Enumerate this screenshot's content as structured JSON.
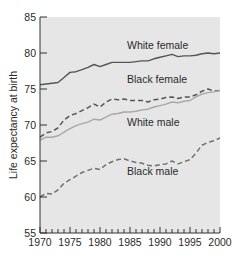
{
  "chart_data": {
    "type": "line",
    "title": "",
    "xlabel": "",
    "ylabel": "Life expectancy at birth",
    "xlim": [
      1970,
      2000
    ],
    "ylim": [
      55,
      85
    ],
    "x_ticks": [
      1970,
      1975,
      1980,
      1985,
      1990,
      1995,
      2000
    ],
    "y_ticks": [
      55,
      60,
      65,
      70,
      75,
      80,
      85
    ],
    "grid": false,
    "legend": "inline labels",
    "x": [
      1970,
      1971,
      1972,
      1973,
      1974,
      1975,
      1976,
      1977,
      1978,
      1979,
      1980,
      1981,
      1982,
      1983,
      1984,
      1985,
      1986,
      1987,
      1988,
      1989,
      1990,
      1991,
      1992,
      1993,
      1994,
      1995,
      1996,
      1997,
      1998,
      1999,
      2000
    ],
    "series": [
      {
        "name": "White female",
        "style": "solid",
        "color": "#555555",
        "label_pos": [
          1984.5,
          80.6
        ],
        "values": [
          75.6,
          75.7,
          75.8,
          75.9,
          76.6,
          77.3,
          77.4,
          77.7,
          78.0,
          78.4,
          78.1,
          78.4,
          78.7,
          78.7,
          78.7,
          78.7,
          78.8,
          78.9,
          78.9,
          79.2,
          79.4,
          79.6,
          79.8,
          79.5,
          79.6,
          79.6,
          79.7,
          79.9,
          80.0,
          79.9,
          80.0
        ]
      },
      {
        "name": "Black female",
        "style": "dashed",
        "color": "#555555",
        "label_pos": [
          1984.5,
          75.8
        ],
        "values": [
          68.3,
          68.9,
          69.1,
          69.6,
          70.7,
          71.3,
          71.6,
          72.0,
          72.4,
          72.9,
          72.5,
          73.2,
          73.6,
          73.5,
          73.6,
          73.4,
          73.4,
          73.4,
          73.2,
          73.5,
          73.6,
          73.8,
          73.9,
          73.7,
          73.9,
          73.9,
          74.2,
          74.7,
          75.0,
          74.7,
          74.8
        ]
      },
      {
        "name": "White male",
        "style": "solid",
        "color": "#a8a8a8",
        "label_pos": [
          1984.5,
          69.8
        ],
        "values": [
          67.9,
          68.3,
          68.3,
          68.5,
          69.0,
          69.5,
          69.9,
          70.2,
          70.4,
          70.8,
          70.7,
          71.1,
          71.5,
          71.6,
          71.8,
          71.8,
          71.9,
          72.1,
          72.2,
          72.5,
          72.7,
          72.9,
          73.2,
          73.1,
          73.3,
          73.4,
          73.9,
          74.3,
          74.5,
          74.6,
          74.8
        ]
      },
      {
        "name": "Black male",
        "style": "dashed",
        "color": "#707070",
        "label_pos": [
          1984.5,
          63.0
        ],
        "values": [
          60.0,
          60.5,
          60.4,
          61.0,
          61.9,
          62.4,
          62.9,
          63.4,
          63.7,
          64.0,
          63.8,
          64.5,
          64.9,
          65.2,
          65.3,
          65.0,
          64.8,
          64.7,
          64.4,
          64.3,
          64.5,
          64.6,
          65.0,
          64.6,
          64.9,
          65.2,
          66.1,
          67.2,
          67.6,
          67.8,
          68.2
        ]
      }
    ]
  },
  "colors": {
    "plot_background": "#e6e6e6",
    "axis": "#333333"
  }
}
